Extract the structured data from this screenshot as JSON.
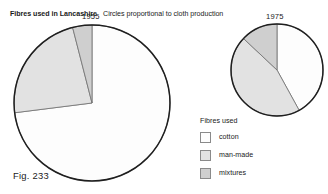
{
  "figure": {
    "caption": "Fig. 233",
    "title_main": "Fibres used in Lancashire",
    "title_sub": "Circles proportional to cloth production"
  },
  "legend": {
    "title": "Fibres used",
    "items": [
      {
        "label": "cotton",
        "color": "#fdfdfd",
        "key": "cotton"
      },
      {
        "label": "man-made",
        "color": "#e2e2e2",
        "key": "man-made"
      },
      {
        "label": "mixtures",
        "color": "#cfcfcf",
        "key": "mixtures"
      }
    ]
  },
  "pies": [
    {
      "year": "1955"
    },
    {
      "year": "1975"
    }
  ],
  "colors": {
    "cotton": "#fdfdfd",
    "man_made": "#e2e2e2",
    "mixtures": "#cfcfcf",
    "outline": "#1f1f1f",
    "slice_edge": "#707070",
    "text": "#1a1a1a",
    "background": "#ffffff"
  },
  "chart_data": {
    "type": "pie",
    "title": "Fibres used in Lancashire",
    "subtitle": "Circles proportional to cloth production",
    "note": "Circles proportional to cloth production",
    "legend_position": "bottom-right",
    "legend_title": "Fibres used",
    "categories": [
      "cotton",
      "man-made",
      "mixtures"
    ],
    "charts": [
      {
        "label": "1955",
        "radius_px": 78,
        "center_px": [
          92,
          103
        ],
        "values": [
          73,
          23,
          4
        ],
        "unit": "percent"
      },
      {
        "label": "1975",
        "radius_px": 46,
        "center_px": [
          277,
          70
        ],
        "values": [
          42,
          45,
          13
        ],
        "unit": "percent"
      }
    ]
  }
}
